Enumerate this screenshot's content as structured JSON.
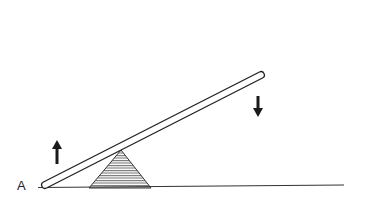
{
  "diagram": {
    "type": "lever-seesaw",
    "labels": {
      "point_a": "A"
    },
    "colors": {
      "ink": "#222222",
      "hatch": "#555555",
      "background": "#ffffff"
    },
    "elements": {
      "ground_line": {
        "x1": 38,
        "y1": 187,
        "x2": 344,
        "y2": 185
      },
      "beam": {
        "x1": 45,
        "y1": 185,
        "x2": 261,
        "y2": 75,
        "thickness": 7
      },
      "fulcrum": {
        "apex": [
          121,
          150
        ],
        "base_left": [
          89,
          188
        ],
        "base_right": [
          151,
          188
        ],
        "fill": "horizontal-hatch"
      },
      "arrow_up": {
        "x": 57,
        "y_tail": 164,
        "y_head": 140,
        "direction": "up"
      },
      "arrow_down": {
        "x": 258,
        "y_tail": 96,
        "y_head": 117,
        "direction": "down"
      }
    }
  }
}
